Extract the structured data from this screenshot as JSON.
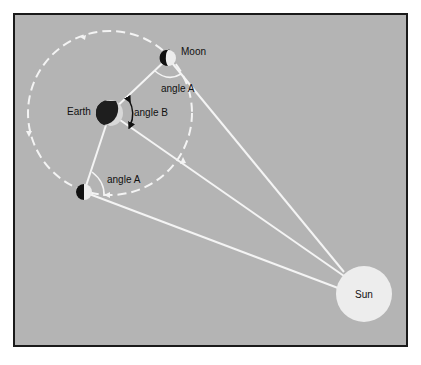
{
  "diagram": {
    "type": "astronomy-geometry",
    "labels": {
      "moon": "Moon",
      "earth": "Earth",
      "sun": "Sun",
      "angle_a_top": "angle A",
      "angle_a_bottom": "angle A",
      "angle_b": "angle B"
    },
    "colors": {
      "background": "#b4b4b4",
      "frame": "#1a1a1a",
      "lines": "#f2f2f2",
      "sun": "#ededed"
    }
  }
}
